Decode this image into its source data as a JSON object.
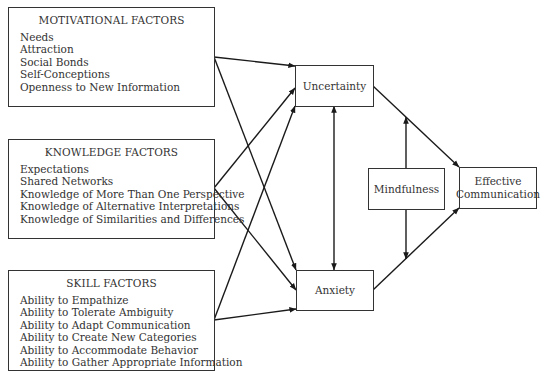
{
  "factor_boxes": {
    "motivational": {
      "title": "MOTIVATIONAL FACTORS",
      "items": [
        "Needs",
        "Attraction",
        "Social Bonds",
        "Self-Conceptions",
        "Openness to New Information"
      ]
    },
    "knowledge": {
      "title": "KNOWLEDGE FACTORS",
      "items": [
        "Expectations",
        "Shared Networks",
        "Knowledge of More Than One Perspective",
        "Knowledge of Alternative Interpretations",
        "Knowledge of Similarities and Differences"
      ]
    },
    "skill": {
      "title": "SKILL FACTORS",
      "items": [
        "Ability to Empathize",
        "Ability to Tolerate Ambiguity",
        "Ability to Adapt Communication",
        "Ability to Create New Categories",
        "Ability to Accommodate Behavior",
        "Ability to Gather Appropriate Information"
      ]
    }
  },
  "nodes": {
    "uncertainty": "Uncertainty",
    "anxiety": "Anxiety",
    "mindfulness": "Mindfulness",
    "effective_line1": "Effective",
    "effective_line2": "Communication"
  },
  "edges": [
    {
      "from": "Motivational Factors",
      "to": "Uncertainty"
    },
    {
      "from": "Motivational Factors",
      "to": "Anxiety"
    },
    {
      "from": "Knowledge Factors",
      "to": "Uncertainty"
    },
    {
      "from": "Knowledge Factors",
      "to": "Anxiety"
    },
    {
      "from": "Skill Factors",
      "to": "Uncertainty"
    },
    {
      "from": "Skill Factors",
      "to": "Anxiety"
    },
    {
      "from": "Uncertainty",
      "to": "Anxiety",
      "bidirectional": true
    },
    {
      "from": "Uncertainty",
      "to": "Effective Communication"
    },
    {
      "from": "Anxiety",
      "to": "Effective Communication"
    },
    {
      "from": "Mindfulness",
      "to": "Uncertainty-Effective Communication link"
    },
    {
      "from": "Mindfulness",
      "to": "Anxiety-Effective Communication link"
    }
  ],
  "colors": {
    "line": "#1a1a1a",
    "border": "#333333",
    "text": "#333333",
    "background": "#ffffff"
  }
}
